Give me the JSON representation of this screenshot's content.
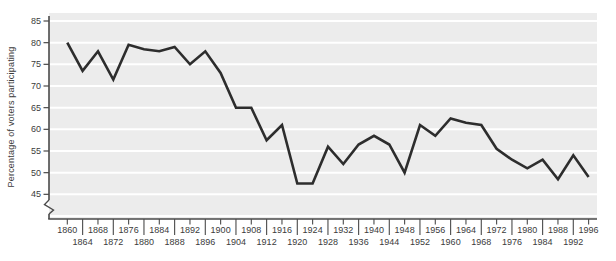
{
  "chart_data": {
    "type": "line",
    "title": "",
    "ylabel": "Percentage of voters participating",
    "xlabel": "",
    "x": [
      1860,
      1864,
      1868,
      1872,
      1876,
      1880,
      1884,
      1888,
      1892,
      1896,
      1900,
      1904,
      1908,
      1912,
      1916,
      1920,
      1924,
      1928,
      1932,
      1936,
      1940,
      1944,
      1948,
      1952,
      1956,
      1960,
      1964,
      1968,
      1972,
      1976,
      1980,
      1984,
      1988,
      1992,
      1996
    ],
    "values": [
      80,
      73.5,
      78,
      71.5,
      79.5,
      78.5,
      78,
      79,
      75,
      78,
      73,
      65,
      65,
      57.5,
      61,
      47.5,
      47.5,
      56,
      52,
      56.5,
      58.5,
      56.5,
      50,
      61,
      58.5,
      62.5,
      61.5,
      61,
      55.5,
      53,
      51,
      53,
      48.5,
      54,
      49
    ],
    "ylim": [
      45,
      85
    ],
    "yticks": [
      45,
      50,
      55,
      60,
      65,
      70,
      75,
      80,
      85
    ],
    "ytick_step": 5,
    "xtick_stagger": true,
    "axis_break": true,
    "legend_position": "none",
    "grid": "horizontal",
    "colors": {
      "line": "#2d2d2d",
      "plot_bg": "#ececec",
      "gridline": "#ffffff",
      "axis": "#4a4a4a",
      "tick": "#4a4a4a",
      "text": "#3b3b3b"
    }
  }
}
